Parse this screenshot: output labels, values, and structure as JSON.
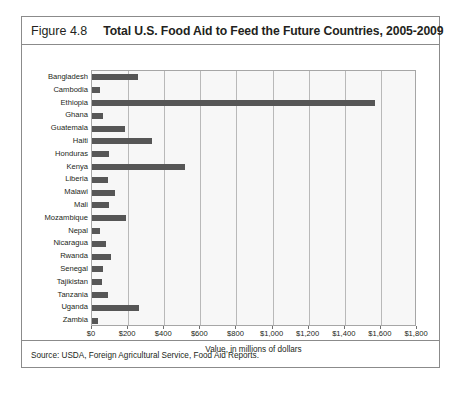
{
  "figure": {
    "number_label": "Figure 4.8",
    "title": "Total U.S. Food Aid to Feed the Future Countries, 2005-2009",
    "source_note": "Source: USDA, Foreign Agricultural Service, Food Aid Reports.",
    "colors": {
      "bar": "#565656",
      "plot_background": "#f7f7f7",
      "gridline": "#b9b9b9",
      "frame_border": "#8b8b8b",
      "text": "#231f20"
    }
  },
  "chart_data": {
    "type": "bar",
    "orientation": "horizontal",
    "title": "Total U.S. Food Aid to Feed the Future Countries, 2005-2009",
    "subtitle": "",
    "xlabel": "Value, in millions of dollars",
    "ylabel": "",
    "xlim": [
      0,
      1800
    ],
    "ylim": null,
    "grid": true,
    "legend": false,
    "legend_position": "none",
    "xticks": [
      0,
      200,
      400,
      600,
      800,
      1000,
      1200,
      1400,
      1600,
      1800
    ],
    "xticklabels": [
      "$0",
      "$200",
      "$400",
      "$600",
      "$800",
      "$1,000",
      "$1,200",
      "$1,400",
      "$1,600",
      "$1,800"
    ],
    "categories": [
      "Bangladesh",
      "Cambodia",
      "Ethiopia",
      "Ghana",
      "Guatemala",
      "Haiti",
      "Honduras",
      "Kenya",
      "Liberia",
      "Malawi",
      "Mali",
      "Mozambique",
      "Nepal",
      "Nicaragua",
      "Rwanda",
      "Senegal",
      "Tajikistan",
      "Tanzania",
      "Uganda",
      "Zambia"
    ],
    "values": [
      255,
      45,
      1565,
      60,
      180,
      330,
      95,
      515,
      90,
      130,
      95,
      190,
      45,
      75,
      105,
      60,
      58,
      90,
      260,
      35
    ]
  }
}
